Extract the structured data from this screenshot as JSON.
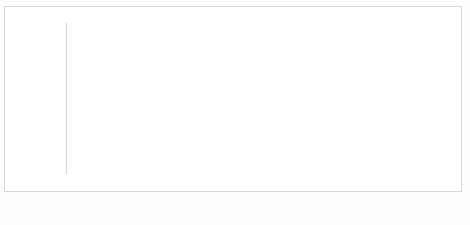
{
  "chart_data": {
    "type": "bar",
    "title": "",
    "xlabel": "",
    "ylabel": "",
    "ylim": [
      0,
      25000
    ],
    "grid": true,
    "legend_position": "bottom",
    "categories": [
      "2000-2001",
      "2003-2004",
      "2006-2007",
      "2009-2010",
      "2012-2013"
    ],
    "ytick_labels": [
      "$0",
      "$5,000",
      "$10,000",
      "$15,000",
      "$20,000",
      "$25,000"
    ],
    "ytick_values": [
      0,
      5000,
      10000,
      15000,
      20000,
      25000
    ],
    "series": [
      {
        "name": "State Appropriations per FTE",
        "type": "area-upper",
        "color": "#a8a8a8",
        "values": [
          13400,
          12900,
          12700,
          13600,
          15400
        ]
      },
      {
        "name": "Tuition Revenue per Student",
        "type": "area-lower",
        "color": "#a8a8a8",
        "values": [
          4200,
          4600,
          5100,
          5900,
          6800
        ]
      },
      {
        "name": "Average Debt of Student",
        "type": "bar",
        "color": "#151515",
        "values": [
          14800,
          16700,
          19000,
          22800,
          24000
        ]
      }
    ]
  },
  "legend": {
    "items": [
      {
        "label": "State Appropriations per FTE",
        "marker": "none"
      },
      {
        "label": "Tuition Revenue per Student",
        "marker": "gray"
      },
      {
        "label": "Average Debt of Student",
        "marker": "black"
      }
    ]
  },
  "caption": {
    "text": "Figure 12.5  Relative Incr"
  }
}
